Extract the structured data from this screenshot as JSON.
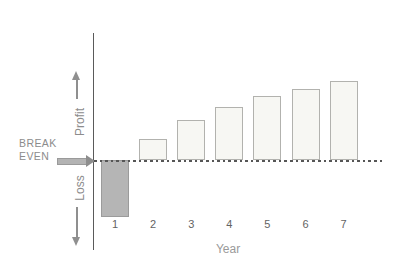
{
  "chart_data": {
    "type": "bar",
    "title": "",
    "xlabel": "Year",
    "ylabel": "",
    "categories": [
      "1",
      "2",
      "3",
      "4",
      "5",
      "6",
      "7"
    ],
    "series": [
      {
        "name": "Profit/Loss relative to break-even",
        "values": [
          -57,
          21,
          40,
          53,
          64,
          71,
          79
        ]
      }
    ],
    "units": "relative units (no numeric scale shown on chart)",
    "baseline": 0,
    "baseline_line_style": "dashed",
    "gridlines": false,
    "legend_position": "none",
    "annotations": {
      "baseline_label": "BREAK EVEN",
      "positive_region_label": "Profit",
      "negative_region_label": "Loss"
    },
    "colors": {
      "loss_bar_fill": "#b5b5b5",
      "loss_bar_border": "#9b9b9b",
      "profit_bar_fill": "#f7f7f3",
      "profit_bar_border": "#b2b2ae",
      "axis_line": "#5a5a5a",
      "breakeven_dash": "#565656",
      "label_text": "#8c8c8c",
      "tick_text": "#636363",
      "arrow": "#8f8f8f"
    }
  },
  "labels": {
    "break_even_line1": "BREAK",
    "break_even_line2": "EVEN",
    "profit": "Profit",
    "loss": "Loss",
    "year_axis": "Year"
  }
}
